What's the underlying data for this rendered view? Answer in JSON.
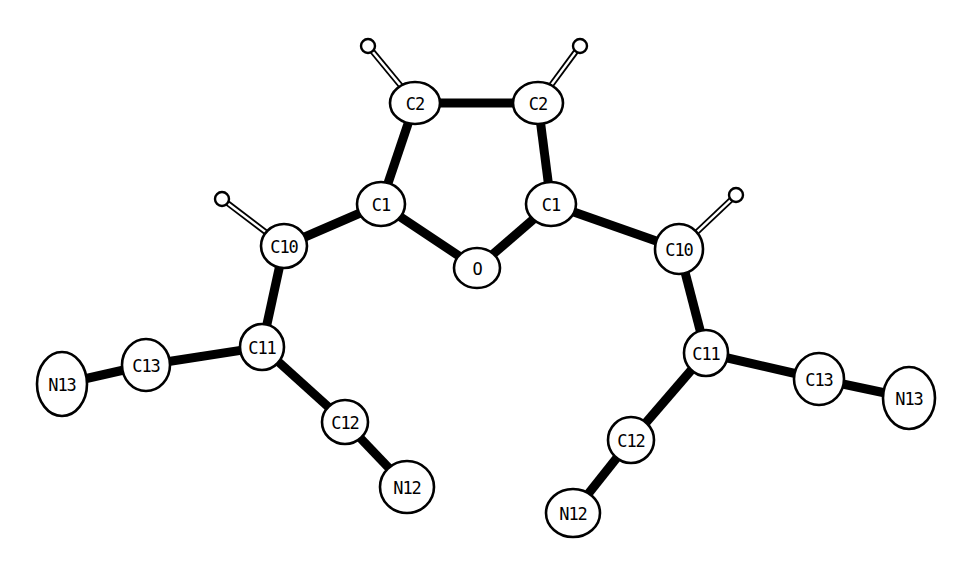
{
  "diagram": {
    "type": "molecular-structure-ortep",
    "background": "#ffffff",
    "ink": "#000000",
    "atoms": [
      {
        "id": "C2a",
        "label": "C2",
        "x": 415,
        "y": 103,
        "rx": 25,
        "ry": 21
      },
      {
        "id": "C2b",
        "label": "C2",
        "x": 538,
        "y": 103,
        "rx": 25,
        "ry": 21
      },
      {
        "id": "C1a",
        "label": "C1",
        "x": 381,
        "y": 204,
        "rx": 24,
        "ry": 22
      },
      {
        "id": "C1b",
        "label": "C1",
        "x": 551,
        "y": 204,
        "rx": 25,
        "ry": 22
      },
      {
        "id": "O",
        "label": "O",
        "x": 477,
        "y": 268,
        "rx": 23,
        "ry": 20
      },
      {
        "id": "C10a",
        "label": "C10",
        "x": 284,
        "y": 246,
        "rx": 23,
        "ry": 22
      },
      {
        "id": "C10b",
        "label": "C10",
        "x": 679,
        "y": 249,
        "rx": 24,
        "ry": 25
      },
      {
        "id": "C11a",
        "label": "C11",
        "x": 262,
        "y": 347,
        "rx": 22,
        "ry": 23
      },
      {
        "id": "C11b",
        "label": "C11",
        "x": 706,
        "y": 353,
        "rx": 22,
        "ry": 23
      },
      {
        "id": "C13a",
        "label": "C13",
        "x": 146,
        "y": 365,
        "rx": 24,
        "ry": 26
      },
      {
        "id": "C13b",
        "label": "C13",
        "x": 819,
        "y": 379,
        "rx": 25,
        "ry": 26
      },
      {
        "id": "N13a",
        "label": "N13",
        "x": 62,
        "y": 384,
        "rx": 25,
        "ry": 32
      },
      {
        "id": "N13b",
        "label": "N13",
        "x": 909,
        "y": 398,
        "rx": 26,
        "ry": 31
      },
      {
        "id": "C12a",
        "label": "C12",
        "x": 345,
        "y": 422,
        "rx": 23,
        "ry": 22
      },
      {
        "id": "C12b",
        "label": "C12",
        "x": 631,
        "y": 440,
        "rx": 23,
        "ry": 23
      },
      {
        "id": "N12a",
        "label": "N12",
        "x": 407,
        "y": 487,
        "rx": 27,
        "ry": 26
      },
      {
        "id": "N12b",
        "label": "N12",
        "x": 573,
        "y": 513,
        "rx": 27,
        "ry": 24
      }
    ],
    "hydrogens": [
      {
        "id": "H2a",
        "x": 368,
        "y": 46,
        "r": 7,
        "parent": "C2a"
      },
      {
        "id": "H2b",
        "x": 580,
        "y": 46,
        "r": 7,
        "parent": "C2b"
      },
      {
        "id": "H10a",
        "x": 222,
        "y": 199,
        "r": 7,
        "parent": "C10a"
      },
      {
        "id": "H10b",
        "x": 736,
        "y": 195,
        "r": 7,
        "parent": "C10b"
      }
    ],
    "bonds": [
      [
        "C2a",
        "C2b"
      ],
      [
        "C2a",
        "C1a"
      ],
      [
        "C2b",
        "C1b"
      ],
      [
        "C1a",
        "O"
      ],
      [
        "C1b",
        "O"
      ],
      [
        "C1a",
        "C10a"
      ],
      [
        "C1b",
        "C10b"
      ],
      [
        "C10a",
        "C11a"
      ],
      [
        "C10b",
        "C11b"
      ],
      [
        "C11a",
        "C13a"
      ],
      [
        "C13a",
        "N13a"
      ],
      [
        "C11b",
        "C13b"
      ],
      [
        "C13b",
        "N13b"
      ],
      [
        "C11a",
        "C12a"
      ],
      [
        "C12a",
        "N12a"
      ],
      [
        "C11b",
        "C12b"
      ],
      [
        "C12b",
        "N12b"
      ]
    ]
  }
}
